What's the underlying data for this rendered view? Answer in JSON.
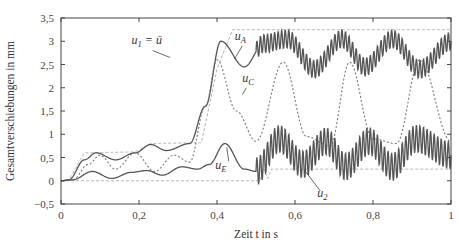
{
  "chart_data": {
    "type": "line",
    "title": "",
    "xlabel": "Zeit t in s",
    "ylabel": "Gesamtverschiebungen in mm",
    "xlim": [
      0,
      1
    ],
    "ylim": [
      -0.5,
      3.5
    ],
    "xticks": [
      0,
      0.2,
      0.4,
      0.6,
      0.8,
      1
    ],
    "xtick_labels": [
      "0",
      "0,2",
      "0,4",
      "0,6",
      "0,8",
      "1"
    ],
    "yticks": [
      -0.5,
      0,
      0.5,
      1,
      1.5,
      2,
      2.5,
      3,
      3.5
    ],
    "ytick_labels": [
      "-0,5",
      "0",
      "0,5",
      "1",
      "1,5",
      "2",
      "2,5",
      "3",
      "3,5"
    ],
    "grid": false,
    "legend": "inline annotations",
    "series": [
      {
        "name": "u1 = ū",
        "style": "dashed-light",
        "x": [
          0,
          0.02,
          0.06,
          0.19,
          0.23,
          0.36,
          0.4,
          0.44,
          1.0
        ],
        "y": [
          0,
          0.02,
          0.6,
          0.62,
          0.8,
          0.82,
          2.4,
          3.25,
          3.25
        ]
      },
      {
        "name": "u2",
        "style": "dashed-light",
        "x": [
          0,
          0.51,
          0.52,
          0.53,
          0.54,
          1.0
        ],
        "y": [
          0,
          0.0,
          0.25,
          0.05,
          0.25,
          0.25
        ]
      },
      {
        "name": "uA",
        "style": "solid",
        "x": [
          0,
          0.02,
          0.06,
          0.09,
          0.14,
          0.19,
          0.23,
          0.27,
          0.33,
          0.37,
          0.41,
          0.47,
          0.52,
          0.58,
          0.65,
          0.72,
          0.78,
          0.85,
          0.92,
          1.0
        ],
        "y": [
          0,
          0.02,
          0.45,
          0.6,
          0.45,
          0.6,
          0.78,
          0.65,
          0.8,
          1.6,
          3.0,
          2.45,
          2.95,
          3.05,
          2.4,
          3.05,
          2.45,
          3.05,
          2.4,
          3.0
        ],
        "vibration_amplitude": 0.2
      },
      {
        "name": "uC",
        "style": "dotted",
        "x": [
          0,
          0.03,
          0.07,
          0.1,
          0.14,
          0.19,
          0.24,
          0.29,
          0.33,
          0.37,
          0.4,
          0.45,
          0.5,
          0.57,
          0.63,
          0.69,
          0.74,
          0.8,
          0.86,
          0.92,
          1.0
        ],
        "y": [
          0,
          0.02,
          0.35,
          0.55,
          0.25,
          0.6,
          0.2,
          0.55,
          0.4,
          1.6,
          2.6,
          1.5,
          0.85,
          2.55,
          0.95,
          0.75,
          2.55,
          0.9,
          0.8,
          2.6,
          0.85
        ]
      },
      {
        "name": "uE",
        "style": "solid",
        "x": [
          0,
          0.03,
          0.08,
          0.13,
          0.18,
          0.22,
          0.26,
          0.31,
          0.35,
          0.38,
          0.42,
          0.47,
          0.5,
          0.56,
          0.62,
          0.68,
          0.73,
          0.79,
          0.85,
          0.91,
          1.0
        ],
        "y": [
          0,
          0.02,
          0.2,
          0.05,
          0.18,
          0.22,
          0.12,
          0.3,
          0.25,
          0.35,
          0.8,
          0.25,
          0.2,
          0.9,
          0.35,
          0.85,
          0.3,
          0.85,
          0.3,
          0.9,
          0.55
        ],
        "vibration_amplitude": 0.3
      }
    ],
    "annotations": [
      {
        "text": "u",
        "sub": "1",
        "suffix": " = ū",
        "x": 0.22,
        "y": 2.95
      },
      {
        "text": "u",
        "sub": "A",
        "x": 0.46,
        "y": 3.02
      },
      {
        "text": "u",
        "sub": "C",
        "x": 0.48,
        "y": 2.13
      },
      {
        "text": "u",
        "sub": "E",
        "x": 0.41,
        "y": 0.25
      },
      {
        "text": "u",
        "sub": "2",
        "x": 0.67,
        "y": -0.35
      }
    ]
  },
  "colors": {
    "axis": "#444444",
    "solid_line": "#555555",
    "dotted_line": "#777777",
    "dashed_light": "#aaaaaa"
  }
}
